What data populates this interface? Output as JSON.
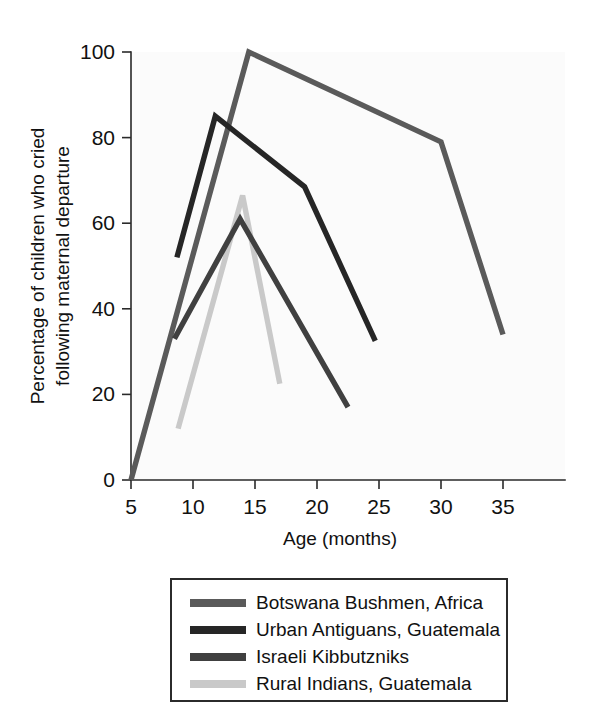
{
  "chart_data": {
    "type": "line",
    "title": "",
    "xlabel": "Age (months)",
    "ylabel": "Percentage of children who cried\nfollowing maternal departure",
    "ylabel_line1": "Percentage of children who cried",
    "ylabel_line2": "following maternal departure",
    "xlim": [
      5,
      40
    ],
    "ylim": [
      0,
      100
    ],
    "xticks": [
      5,
      10,
      15,
      20,
      25,
      30,
      35
    ],
    "yticks": [
      0,
      20,
      40,
      60,
      80,
      100
    ],
    "xtick_labels": [
      "5",
      "10",
      "15",
      "20",
      "25",
      "30",
      "35"
    ],
    "ytick_labels": [
      "0",
      "20",
      "40",
      "60",
      "80",
      "100"
    ],
    "grid": false,
    "legend_position": "below-center",
    "series": [
      {
        "name": "Botswana Bushmen, Africa",
        "color": "#5a5a5a",
        "x": [
          5,
          14.5,
          30,
          35
        ],
        "y": [
          0,
          100,
          79,
          34
        ]
      },
      {
        "name": "Urban Antiguans, Guatemala",
        "color": "#262626",
        "x": [
          8.7,
          11.8,
          19,
          24.7
        ],
        "y": [
          52,
          85,
          68.5,
          32.5
        ]
      },
      {
        "name": "Israeli Kibbutzniks",
        "color": "#404040",
        "x": [
          8.5,
          13.8,
          22.5
        ],
        "y": [
          33,
          61,
          17
        ]
      },
      {
        "name": "Rural Indians, Guatemala",
        "color": "#c9c9c9",
        "x": [
          8.8,
          14.0,
          17.0
        ],
        "y": [
          12,
          66.5,
          22.5
        ]
      }
    ]
  },
  "legend": {
    "entries": [
      {
        "label": "Botswana Bushmen, Africa",
        "color": "#5a5a5a"
      },
      {
        "label": "Urban Antiguans, Guatemala",
        "color": "#262626"
      },
      {
        "label": "Israeli Kibbutzniks",
        "color": "#404040"
      },
      {
        "label": "Rural Indians, Guatemala",
        "color": "#c9c9c9"
      }
    ]
  }
}
